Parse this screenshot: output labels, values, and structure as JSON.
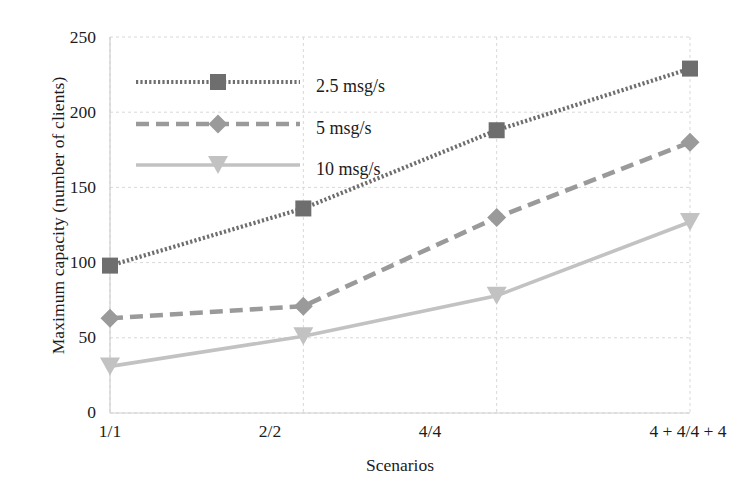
{
  "chart_data": {
    "type": "line",
    "title": "",
    "xlabel": "Scenarios",
    "ylabel": "Maximum capacity (number of clients)",
    "categories": [
      "1/1",
      "2/2",
      "4/4",
      "4 + 4/4 + 4"
    ],
    "yticks": [
      0,
      50,
      100,
      150,
      200,
      250
    ],
    "ylim": [
      0,
      250
    ],
    "grid": true,
    "legend_position": "upper-left-inside",
    "series": [
      {
        "name": "2.5 msg/s",
        "values": [
          98,
          136,
          188,
          229
        ],
        "color": "#6e6e6e",
        "marker": "square",
        "linestyle": "dotted"
      },
      {
        "name": "5 msg/s",
        "values": [
          63,
          71,
          130,
          180
        ],
        "color": "#9a9a9a",
        "marker": "diamond",
        "linestyle": "dashed"
      },
      {
        "name": "10 msg/s",
        "values": [
          31,
          51,
          78,
          127
        ],
        "color": "#c2c2c2",
        "marker": "triangle-down",
        "linestyle": "solid"
      }
    ]
  },
  "axis": {
    "y_tick_labels": [
      "250",
      "200",
      "150",
      "100",
      "50",
      "0"
    ],
    "x_tick_labels": [
      "1/1",
      "2/2",
      "4/4",
      "4 + 4/4 + 4"
    ],
    "x_title": "Scenarios",
    "y_title": "Maximum capacity (number of clients)"
  },
  "legend": {
    "items": [
      {
        "label": "2.5 msg/s"
      },
      {
        "label": "5 msg/s"
      },
      {
        "label": "10 msg/s"
      }
    ]
  },
  "colors": {
    "series1": "#6e6e6e",
    "series2": "#9a9a9a",
    "series3": "#c2c2c2",
    "grid": "#d8d8d8",
    "text": "#1d1b1c",
    "background": "#ffffff"
  }
}
